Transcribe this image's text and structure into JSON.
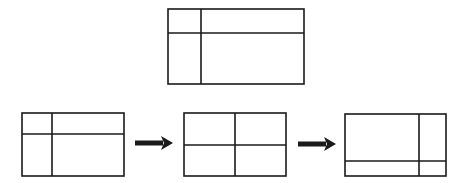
{
  "diagram": {
    "stroke_color": "#1a1a1a",
    "background": "#ffffff",
    "reference_layout": {
      "rect": [
        168,
        9,
        136,
        75
      ],
      "vertical_divider_x": 201,
      "horizontal_divider_y": 33
    },
    "sequence": [
      {
        "name": "layout-1",
        "rect": [
          22,
          113,
          102,
          63
        ],
        "lines": [
          [
            52,
            113,
            52,
            176
          ],
          [
            22,
            134,
            124,
            134
          ]
        ]
      },
      {
        "name": "layout-2",
        "rect": [
          184,
          113,
          102,
          63
        ],
        "lines": [
          [
            235,
            113,
            235,
            176
          ],
          [
            184,
            145,
            286,
            145
          ]
        ]
      },
      {
        "name": "layout-3",
        "rect": [
          345,
          114,
          101,
          62
        ],
        "lines": [
          [
            419,
            114,
            419,
            176
          ],
          [
            345,
            161,
            446,
            161
          ]
        ]
      }
    ],
    "arrows": [
      {
        "from": "layout-1",
        "to": "layout-2",
        "x1": 135,
        "x2": 173,
        "y": 143
      },
      {
        "from": "layout-2",
        "to": "layout-3",
        "x1": 298,
        "x2": 336,
        "y": 144
      }
    ]
  }
}
